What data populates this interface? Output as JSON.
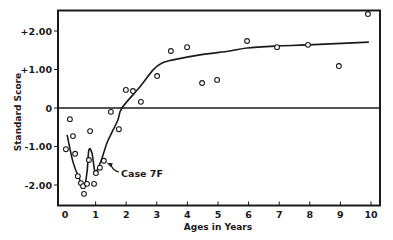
{
  "chart_data": {
    "type": "scatter",
    "title": "",
    "xlabel": "Ages in Years",
    "ylabel": "Standard Score",
    "xlim": [
      0,
      10
    ],
    "ylim": [
      -2.5,
      2.55
    ],
    "x_ticks": [
      0,
      1,
      2,
      3,
      4,
      5,
      6,
      7,
      8,
      9,
      10
    ],
    "x_tick_labels": [
      "0",
      "1",
      "2",
      "3",
      "4",
      "5",
      "6",
      "7",
      "8",
      "9",
      "10"
    ],
    "y_ticks": [
      2,
      1,
      0,
      -1,
      -2
    ],
    "y_tick_labels": [
      "+2.00",
      "+1.00",
      "0",
      "-1.00",
      "-2.00"
    ],
    "grid": false,
    "reference_line": {
      "y": 0
    },
    "series": [
      {
        "name": "observations",
        "kind": "scatter",
        "marker": "open-circle",
        "points": [
          [
            0.03,
            -1.07
          ],
          [
            0.16,
            -0.29
          ],
          [
            0.26,
            -0.73
          ],
          [
            0.33,
            -1.19
          ],
          [
            0.42,
            -1.77
          ],
          [
            0.52,
            -1.95
          ],
          [
            0.59,
            -2.03
          ],
          [
            0.62,
            -2.23
          ],
          [
            0.72,
            -1.97
          ],
          [
            0.78,
            -1.35
          ],
          [
            0.82,
            -0.6
          ],
          [
            0.95,
            -1.97
          ],
          [
            1.01,
            -1.69
          ],
          [
            1.14,
            -1.55
          ],
          [
            1.27,
            -1.37
          ],
          [
            1.5,
            -0.1
          ],
          [
            1.76,
            -0.55
          ],
          [
            1.99,
            0.47
          ],
          [
            2.22,
            0.44
          ],
          [
            2.48,
            0.16
          ],
          [
            3.01,
            0.83
          ],
          [
            3.46,
            1.48
          ],
          [
            3.99,
            1.58
          ],
          [
            4.48,
            0.65
          ],
          [
            4.97,
            0.73
          ],
          [
            5.95,
            1.74
          ],
          [
            6.93,
            1.58
          ],
          [
            7.94,
            1.64
          ],
          [
            8.95,
            1.09
          ],
          [
            9.9,
            2.44
          ]
        ]
      },
      {
        "name": "fitted curve",
        "kind": "line",
        "points": [
          [
            0.07,
            -0.7
          ],
          [
            0.26,
            -1.4
          ],
          [
            0.46,
            -1.82
          ],
          [
            0.62,
            -2.08
          ],
          [
            0.72,
            -1.66
          ],
          [
            0.78,
            -1.09
          ],
          [
            0.88,
            -1.17
          ],
          [
            0.98,
            -1.66
          ],
          [
            1.08,
            -1.56
          ],
          [
            1.21,
            -1.3
          ],
          [
            1.37,
            -0.91
          ],
          [
            1.54,
            -0.62
          ],
          [
            1.73,
            -0.31
          ],
          [
            1.86,
            0.0
          ],
          [
            2.45,
            0.55
          ],
          [
            2.88,
            0.99
          ],
          [
            3.17,
            1.17
          ],
          [
            3.53,
            1.25
          ],
          [
            4.41,
            1.38
          ],
          [
            5.39,
            1.48
          ],
          [
            5.95,
            1.56
          ],
          [
            6.93,
            1.61
          ],
          [
            7.94,
            1.64
          ],
          [
            9.93,
            1.71
          ]
        ]
      }
    ],
    "annotations": [
      {
        "text": "Case 7F",
        "points_to": [
          1.27,
          -1.37
        ]
      }
    ],
    "legend": "none"
  }
}
